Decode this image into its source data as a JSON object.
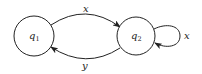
{
  "diagram": {
    "type": "state-machine",
    "nodes": [
      {
        "id": "q1",
        "base": "q",
        "sub": "1",
        "cx": 34,
        "cy": 36,
        "r": 20
      },
      {
        "id": "q2",
        "base": "q",
        "sub": "2",
        "cx": 136,
        "cy": 36,
        "r": 19
      }
    ],
    "edges": [
      {
        "from": "q1",
        "to": "q2",
        "label": "x",
        "position": "top"
      },
      {
        "from": "q2",
        "to": "q1",
        "label": "y",
        "position": "bottom"
      },
      {
        "from": "q2",
        "to": "q2",
        "label": "x",
        "position": "self-loop-right"
      }
    ],
    "colors": {
      "stroke": "#222222",
      "background": "#ffffff"
    }
  }
}
